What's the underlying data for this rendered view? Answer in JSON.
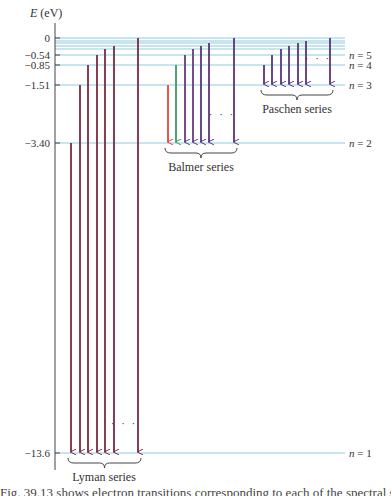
{
  "axis": {
    "label_var": "E",
    "label_unit": " (eV)"
  },
  "levels": [
    {
      "n": 1,
      "energy": "-13.6",
      "y": 453,
      "label": "n = 1",
      "tick_label": "−13.6"
    },
    {
      "n": 2,
      "energy": "-3.40",
      "y": 143,
      "label": "n = 2",
      "tick_label": "−3.40"
    },
    {
      "n": 3,
      "energy": "-1.51",
      "y": 85,
      "label": "n = 3",
      "tick_label": "−1.51"
    },
    {
      "n": 4,
      "energy": "-0.85",
      "y": 65,
      "label": "n = 4",
      "tick_label": "−0.85"
    },
    {
      "n": 5,
      "energy": "-0.54",
      "y": 55,
      "label": "n = 5",
      "tick_label": "−0.54"
    },
    {
      "n": 6,
      "y": 49
    },
    {
      "n": 7,
      "y": 46
    },
    {
      "n": 8,
      "y": 43
    },
    {
      "n": 9,
      "y": 41
    },
    {
      "n": "inf",
      "energy": "0",
      "y": 38,
      "tick_label": "0"
    }
  ],
  "series": [
    {
      "name": "Lyman series",
      "final_n": 1,
      "arrows": [
        {
          "x": 71,
          "from_y": 143,
          "color": "#7a2a3e"
        },
        {
          "x": 80,
          "from_y": 85,
          "color": "#7a2a3e"
        },
        {
          "x": 88,
          "from_y": 65,
          "color": "#7a2a3e"
        },
        {
          "x": 97,
          "from_y": 55,
          "color": "#7a2a3e"
        },
        {
          "x": 105,
          "from_y": 49,
          "color": "#7a2a3e"
        },
        {
          "x": 114,
          "from_y": 46,
          "color": "#7a2a3e"
        },
        {
          "x": 138,
          "from_y": 38,
          "color": "#7a2a3e"
        }
      ],
      "ellipsis_x": 124,
      "ellipsis_y": 427,
      "brace_x1": 68,
      "brace_x2": 141,
      "brace_y": 458,
      "label_x": 104,
      "label_y": 481
    },
    {
      "name": "Balmer series",
      "final_n": 2,
      "arrows": [
        {
          "x": 168,
          "from_y": 85,
          "color": "#e2463a"
        },
        {
          "x": 176,
          "from_y": 65,
          "color": "#3a9a6a"
        },
        {
          "x": 185,
          "from_y": 55,
          "color": "#6a3a7a"
        },
        {
          "x": 193,
          "from_y": 49,
          "color": "#6a3a7a"
        },
        {
          "x": 201,
          "from_y": 46,
          "color": "#5a3478"
        },
        {
          "x": 209,
          "from_y": 43,
          "color": "#5a3478"
        },
        {
          "x": 234,
          "from_y": 38,
          "color": "#5a3478"
        }
      ],
      "ellipsis_x": 222,
      "ellipsis_y": 118,
      "brace_x1": 165,
      "brace_x2": 237,
      "brace_y": 148,
      "label_x": 201,
      "label_y": 171
    },
    {
      "name": "Paschen series",
      "final_n": 3,
      "arrows": [
        {
          "x": 264,
          "from_y": 65,
          "color": "#5a3478"
        },
        {
          "x": 272,
          "from_y": 55,
          "color": "#5a3478"
        },
        {
          "x": 281,
          "from_y": 49,
          "color": "#5a3478"
        },
        {
          "x": 289,
          "from_y": 46,
          "color": "#5a3478"
        },
        {
          "x": 298,
          "from_y": 43,
          "color": "#5a3478"
        },
        {
          "x": 306,
          "from_y": 41,
          "color": "#5a3478"
        },
        {
          "x": 330,
          "from_y": 38,
          "color": "#5a3478"
        }
      ],
      "ellipsis_x": 318,
      "ellipsis_y": 62,
      "brace_x1": 261,
      "brace_x2": 333,
      "brace_y": 90,
      "label_x": 297,
      "label_y": 113
    }
  ],
  "caption_fragment": "Fig. 39.13  shows electron transitions corresponding to each of the spectral series",
  "colors": {
    "level_line": "#8ccbe0",
    "axis": "#444444",
    "text": "#333333"
  }
}
